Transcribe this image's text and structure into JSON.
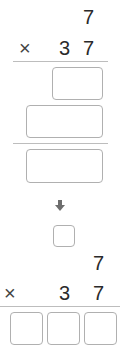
{
  "problem": {
    "top": {
      "multiplicand": "7",
      "operator": "×",
      "multiplier_tens": "3",
      "multiplier_ones": "7",
      "partial_product_1": "",
      "partial_product_2": "",
      "final_product": ""
    },
    "bottom": {
      "carry": "",
      "multiplicand": "7",
      "operator": "×",
      "multiplier_tens": "3",
      "multiplier_ones": "7",
      "answer_hundreds": "",
      "answer_tens": "",
      "answer_ones": ""
    }
  },
  "icons": {
    "arrow": "down-arrow-icon"
  }
}
